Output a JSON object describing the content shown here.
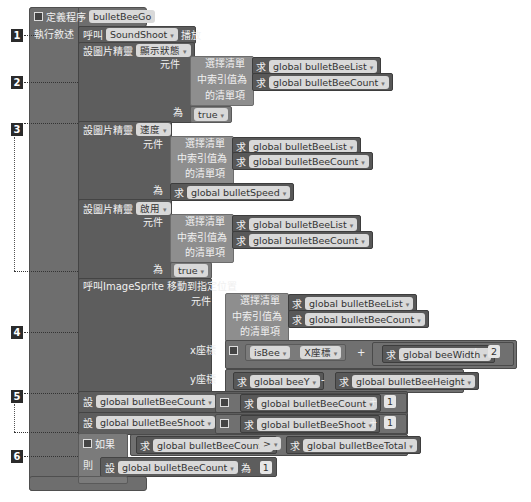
{
  "procedure": {
    "collapse_icon": "minus-box",
    "define_label": "定義程序",
    "name": "bulletBeeGo",
    "do_label": "執行敘述"
  },
  "markers": [
    "1",
    "2",
    "3",
    "4",
    "5",
    "6"
  ],
  "statements": {
    "call_sound": {
      "call": "呼叫",
      "component": "SoundShoot",
      "method": "播放"
    },
    "set_visible": {
      "set": "設圖片精靈",
      "property": "顯示狀態",
      "component_label": "元件",
      "select_list": "選擇清單",
      "index_label": "中索引值為",
      "item_label": "的清單項",
      "get": "求",
      "list_var": "global bulletBeeList",
      "index_var": "global bulletBeeCount",
      "to": "為",
      "value": "true"
    },
    "set_speed": {
      "set": "設圖片精靈",
      "property": "速度",
      "component_label": "元件",
      "select_list": "選擇清單",
      "index_label": "中索引值為",
      "item_label": "的清單項",
      "get": "求",
      "list_var": "global bulletBeeList",
      "index_var": "global bulletBeeCount",
      "to": "為",
      "value_var": "global bulletSpeed"
    },
    "set_enabled": {
      "set": "設圖片精靈",
      "property": "啟用",
      "component_label": "元件",
      "select_list": "選擇清單",
      "index_label": "中索引值為",
      "item_label": "的清單項",
      "get": "求",
      "list_var": "global bulletBeeList",
      "index_var": "global bulletBeeCount",
      "to": "為",
      "value": "true"
    },
    "moveto": {
      "call": "呼叫ImageSprite 移動到指定位置",
      "component_label": "元件",
      "select_list": "選擇清單",
      "index_label": "中索引值為",
      "item_label": "的清單項",
      "get": "求",
      "list_var": "global bulletBeeList",
      "index_var": "global bulletBeeCount",
      "x_label": "x座標",
      "x_component": "isBee",
      "x_property": "X座標",
      "plus": "+",
      "width_var": "global beeWidth",
      "divide": "/",
      "divisor": "2",
      "y_label": "y座標",
      "y_var": "global beeY",
      "minus": "-",
      "height_var": "global bulletBeeHeight"
    },
    "inc_count": {
      "set": "設",
      "var": "global bulletBeeCount",
      "to": "為",
      "get": "求",
      "plus": "+",
      "amount": "1"
    },
    "inc_shoot": {
      "set": "設",
      "var": "global bulletBeeShoot",
      "to": "為",
      "get": "求",
      "plus": "+",
      "amount": "1"
    },
    "if_block": {
      "if": "如果",
      "get": "求",
      "left_var": "global bulletBeeCount",
      "op": ">",
      "right_var": "global bulletBeeTotal",
      "then": "則",
      "set": "設",
      "var": "global bulletBeeCount",
      "to": "為",
      "value": "1"
    }
  },
  "dropdown_glyph": "▾"
}
